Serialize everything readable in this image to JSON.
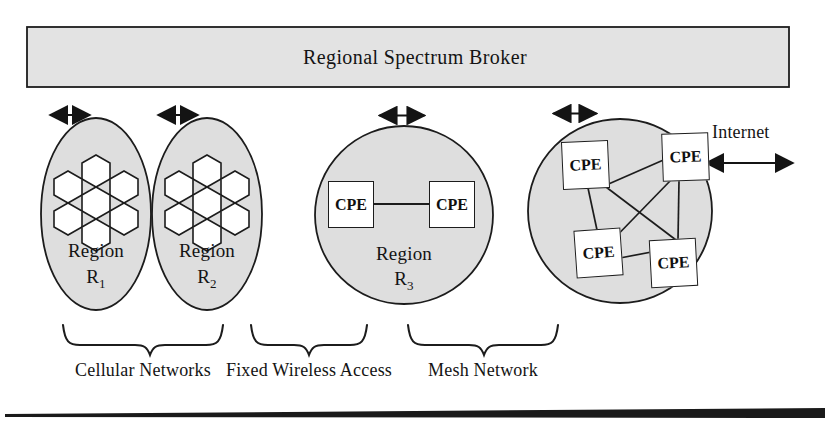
{
  "figure": {
    "broker": {
      "title": "Regional Spectrum Broker"
    },
    "regions": [
      {
        "id": "region-r1",
        "shape": "ellipse",
        "name": "Region",
        "subscript_label": "R",
        "subscript": "1",
        "contents": "hexagonal-cell-cluster",
        "cell_count": 7
      },
      {
        "id": "region-r2",
        "shape": "ellipse",
        "name": "Region",
        "subscript_label": "R",
        "subscript": "2",
        "contents": "hexagonal-cell-cluster",
        "cell_count": 7
      },
      {
        "id": "region-r3",
        "shape": "circle",
        "name": "Region",
        "subscript_label": "R",
        "subscript": "3",
        "contents": "cpe-pair",
        "cpe_count": 2
      },
      {
        "id": "region-mesh",
        "shape": "circle",
        "name": "",
        "subscript_label": "",
        "subscript": "",
        "contents": "cpe-mesh",
        "cpe_count": 4
      }
    ],
    "cpe_label": "CPE",
    "cpe_nodes": {
      "fixed_wireless": [
        "CPE",
        "CPE"
      ],
      "mesh": [
        "CPE",
        "CPE",
        "CPE",
        "CPE"
      ]
    },
    "internet": {
      "label": "Internet"
    },
    "group_labels": [
      "Cellular Networks",
      "Fixed Wireless Access",
      "Mesh Network"
    ],
    "connectors": {
      "broker_links": 4,
      "type": "double-headed-arrow"
    },
    "colors": {
      "region_fill": "#dedede",
      "broker_fill": "#e2e2e2",
      "stroke": "#1c1c1c",
      "text": "#141414",
      "page_background": "#ffffff"
    }
  }
}
